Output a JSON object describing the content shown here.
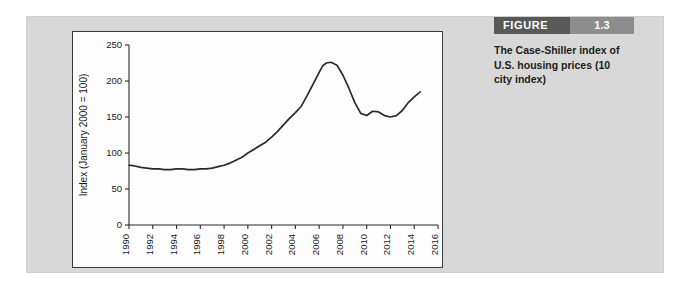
{
  "figure": {
    "badge_word": "FIGURE",
    "number": "1.3",
    "caption": "The Case-Shiller index of U.S. housing prices (10 city index)",
    "badge_word_color": "#595959",
    "badge_number_color": "#8d8d8d",
    "card_color": "#d8d8d8"
  },
  "chart_data": {
    "type": "line",
    "title": "",
    "xlabel": "",
    "ylabel": "Index (January 2000 = 100)",
    "xlim": [
      1990,
      2016
    ],
    "ylim": [
      0,
      250
    ],
    "grid": false,
    "legend": "none",
    "line_color": "#2a2a2a",
    "xticks": [
      1990,
      1992,
      1994,
      1996,
      1998,
      2000,
      2002,
      2004,
      2006,
      2008,
      2010,
      2012,
      2014,
      2016
    ],
    "xtick_labels": [
      "1990",
      "1992",
      "1994",
      "1996",
      "1998",
      "2000",
      "2002",
      "2004",
      "2006",
      "2008",
      "2010",
      "2012",
      "2014",
      "2016"
    ],
    "yticks": [
      0,
      50,
      100,
      150,
      200,
      250
    ],
    "ytick_labels": [
      "0",
      "50",
      "100",
      "150",
      "200",
      "250"
    ],
    "series": [
      {
        "name": "Case-Shiller 10-city index",
        "x": [
          1990.0,
          1990.5,
          1991.0,
          1991.5,
          1992.0,
          1992.5,
          1993.0,
          1993.5,
          1994.0,
          1994.5,
          1995.0,
          1995.5,
          1996.0,
          1996.5,
          1997.0,
          1997.5,
          1998.0,
          1998.5,
          1999.0,
          1999.5,
          2000.0,
          2000.5,
          2001.0,
          2001.5,
          2002.0,
          2002.5,
          2003.0,
          2003.5,
          2004.0,
          2004.5,
          2005.0,
          2005.5,
          2006.0,
          2006.3,
          2006.6,
          2007.0,
          2007.5,
          2008.0,
          2008.5,
          2009.0,
          2009.5,
          2010.0,
          2010.5,
          2011.0,
          2011.5,
          2012.0,
          2012.5,
          2013.0,
          2013.5,
          2014.0,
          2014.5
        ],
        "y": [
          83,
          82,
          80,
          79,
          78,
          78,
          77,
          77,
          78,
          78,
          77,
          77,
          78,
          78,
          79,
          81,
          83,
          86,
          90,
          94,
          100,
          105,
          110,
          115,
          122,
          130,
          139,
          148,
          156,
          165,
          180,
          196,
          212,
          221,
          225,
          226,
          222,
          208,
          190,
          170,
          155,
          152,
          158,
          157,
          152,
          150,
          152,
          159,
          170,
          178,
          185
        ]
      }
    ]
  }
}
